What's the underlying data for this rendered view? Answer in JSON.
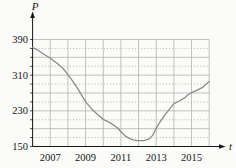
{
  "chart_data": {
    "type": "line",
    "title": "",
    "xlabel": "t",
    "ylabel": "P",
    "xlim": [
      2006,
      2016
    ],
    "ylim": [
      150,
      390
    ],
    "x_tick_years": [
      2007,
      2009,
      2011,
      2013,
      2015
    ],
    "x_tick_labels": [
      "2007",
      "2009",
      "2011",
      "2013",
      "2015"
    ],
    "y_tick_values": [
      390,
      310,
      230,
      150
    ],
    "y_tick_labels": [
      "390",
      "310",
      "230",
      "150"
    ],
    "grid": {
      "on": true,
      "x_step_years": 1,
      "y_step": 20,
      "solid_y_step": 40
    },
    "legend": {
      "visible": false
    },
    "series": [
      {
        "name": "P",
        "x": [
          2006.0,
          2006.3,
          2006.6,
          2007.0,
          2007.4,
          2007.7,
          2008.0,
          2008.3,
          2008.6,
          2009.0,
          2009.4,
          2009.7,
          2010.0,
          2010.4,
          2010.8,
          2011.0,
          2011.3,
          2011.6,
          2011.9,
          2012.3,
          2012.6,
          2012.8,
          2013.0,
          2013.2,
          2013.5,
          2013.8,
          2014.0,
          2014.3,
          2014.6,
          2014.8,
          2015.0,
          2015.3,
          2015.6,
          2015.8,
          2016.0
        ],
        "y": [
          372,
          366,
          358,
          348,
          336,
          326,
          311,
          295,
          277,
          250,
          232,
          221,
          211,
          203,
          192,
          183,
          172,
          166,
          163,
          163,
          167,
          175,
          191,
          204,
          221,
          236,
          246,
          252,
          259,
          266,
          271,
          276,
          282,
          289,
          296
        ]
      }
    ],
    "colors": {
      "background": "#fbfbf9",
      "curve": "#8c8c8c",
      "grid": "#aeaeae",
      "axis": "#161616",
      "text": "#161616"
    }
  }
}
